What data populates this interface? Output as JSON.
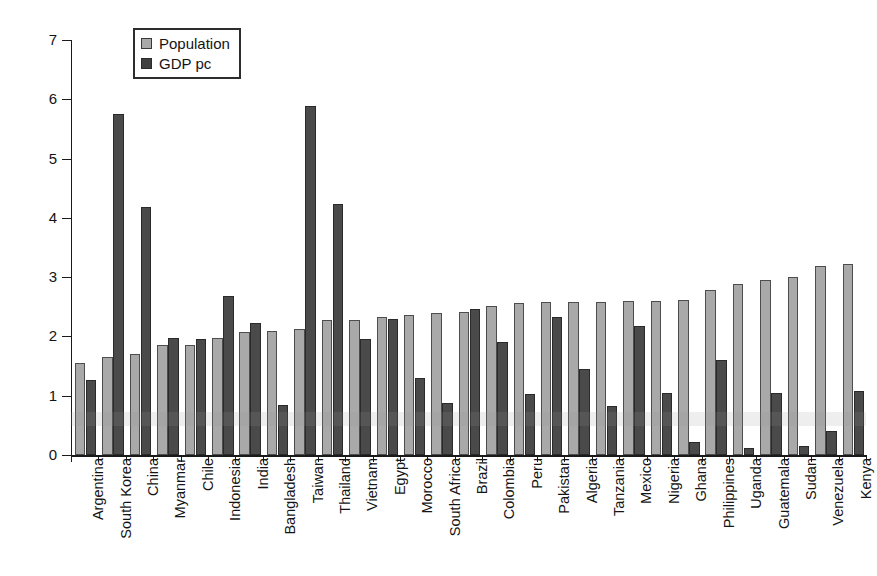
{
  "chart_data": {
    "type": "bar",
    "title": "",
    "subtitle": "",
    "xlabel": "",
    "ylabel": "% annual increase",
    "ylim": [
      0,
      7
    ],
    "ytick_labels": [
      "0",
      "1",
      "2",
      "3",
      "4",
      "5",
      "6",
      "7"
    ],
    "ytick_values": [
      0,
      1,
      2,
      3,
      4,
      5,
      6,
      7
    ],
    "grid": false,
    "legend_position": "top-left",
    "categories": [
      "Argentina",
      "South Korea",
      "China",
      "Myanmar",
      "Chile",
      "Indonesia",
      "India",
      "Bangladesh",
      "Taiwan",
      "Thailand",
      "Vietnam",
      "Egypt",
      "Morocco",
      "South Africa",
      "Brazil",
      "Colombia",
      "Peru",
      "Pakistan",
      "Algeria",
      "Tanzania",
      "Mexico",
      "Nigeria",
      "Ghana",
      "Philippines",
      "Uganda",
      "Guatemala",
      "Sudan",
      "Venezuela",
      "Kenya"
    ],
    "series": [
      {
        "name": "Population",
        "color": "#a9a9a9",
        "values": [
          1.55,
          1.65,
          1.7,
          1.85,
          1.85,
          1.98,
          2.08,
          2.1,
          2.13,
          2.27,
          2.28,
          2.33,
          2.37,
          2.4,
          2.42,
          2.52,
          2.57,
          2.58,
          2.58,
          2.58,
          2.6,
          2.6,
          2.62,
          2.78,
          2.88,
          2.95,
          3.0,
          3.18,
          3.22
        ]
      },
      {
        "name": "GDP pc",
        "color": "#4a4a4a",
        "values": [
          1.27,
          5.75,
          4.18,
          1.98,
          1.95,
          2.68,
          2.22,
          0.85,
          5.88,
          4.23,
          1.95,
          2.3,
          1.3,
          0.88,
          2.47,
          1.9,
          1.03,
          2.32,
          1.45,
          0.82,
          2.18,
          1.05,
          0.22,
          1.6,
          0.12,
          1.05,
          0.15,
          0.4,
          1.08
        ]
      }
    ]
  },
  "legend": {
    "items": [
      {
        "label": "Population",
        "swatch": "population-swatch"
      },
      {
        "label": "GDP pc",
        "swatch": "gdp-pc-swatch"
      }
    ]
  },
  "axis": {
    "y_title": "% annual increase"
  }
}
